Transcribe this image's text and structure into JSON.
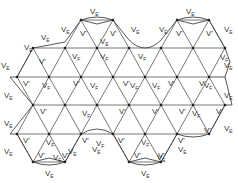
{
  "diagram": {
    "type": "triangular-lattice",
    "colors": {
      "line": "#555555",
      "boundary": "#444444",
      "text": "#333333",
      "background": "#ffffff"
    },
    "labels": {
      "edge_vertex": {
        "main": "V",
        "sub": "E"
      },
      "interior_vertex_prime": "V'",
      "interior_vertex_f": {
        "main": "V",
        "sub": "F"
      }
    },
    "rows_y": [
      20,
      48,
      77,
      105,
      134,
      162
    ],
    "nodes": [
      {
        "x": 81,
        "y": 20
      },
      {
        "x": 113,
        "y": 20
      },
      {
        "x": 177,
        "y": 20
      },
      {
        "x": 209,
        "y": 20
      },
      {
        "x": 33,
        "y": 48
      },
      {
        "x": 65,
        "y": 48
      },
      {
        "x": 97,
        "y": 48
      },
      {
        "x": 129,
        "y": 48
      },
      {
        "x": 161,
        "y": 48
      },
      {
        "x": 193,
        "y": 48
      },
      {
        "x": 225,
        "y": 48
      },
      {
        "x": 17,
        "y": 77
      },
      {
        "x": 49,
        "y": 77
      },
      {
        "x": 81,
        "y": 77
      },
      {
        "x": 113,
        "y": 77
      },
      {
        "x": 145,
        "y": 77
      },
      {
        "x": 177,
        "y": 77
      },
      {
        "x": 209,
        "y": 77
      },
      {
        "x": 33,
        "y": 105
      },
      {
        "x": 65,
        "y": 105
      },
      {
        "x": 97,
        "y": 105
      },
      {
        "x": 129,
        "y": 105
      },
      {
        "x": 161,
        "y": 105
      },
      {
        "x": 193,
        "y": 105
      },
      {
        "x": 225,
        "y": 105
      },
      {
        "x": 17,
        "y": 134
      },
      {
        "x": 49,
        "y": 134
      },
      {
        "x": 81,
        "y": 134
      },
      {
        "x": 113,
        "y": 134
      },
      {
        "x": 145,
        "y": 134
      },
      {
        "x": 177,
        "y": 134
      },
      {
        "x": 209,
        "y": 134
      },
      {
        "x": 33,
        "y": 162
      },
      {
        "x": 65,
        "y": 162
      },
      {
        "x": 129,
        "y": 162
      },
      {
        "x": 161,
        "y": 162
      }
    ],
    "ve_labels": [
      {
        "x": 90,
        "y": 8
      },
      {
        "x": 186,
        "y": 8
      },
      {
        "x": 61,
        "y": 26
      },
      {
        "x": 131,
        "y": 26
      },
      {
        "x": 159,
        "y": 26
      },
      {
        "x": 224,
        "y": 26
      },
      {
        "x": 41,
        "y": 34
      },
      {
        "x": 24,
        "y": 44
      },
      {
        "x": 100,
        "y": 38
      },
      {
        "x": 1,
        "y": 62
      },
      {
        "x": 224,
        "y": 62
      },
      {
        "x": 4,
        "y": 92
      },
      {
        "x": 224,
        "y": 92
      },
      {
        "x": 4,
        "y": 120
      },
      {
        "x": 224,
        "y": 125
      },
      {
        "x": 4,
        "y": 148
      },
      {
        "x": 68,
        "y": 148
      },
      {
        "x": 92,
        "y": 146
      },
      {
        "x": 178,
        "y": 146
      },
      {
        "x": 45,
        "y": 170
      },
      {
        "x": 141,
        "y": 170
      },
      {
        "x": 53,
        "y": 154
      },
      {
        "x": 157,
        "y": 154
      }
    ],
    "vprime_labels": [
      {
        "x": 80,
        "y": 30
      },
      {
        "x": 110,
        "y": 30
      },
      {
        "x": 176,
        "y": 30
      },
      {
        "x": 206,
        "y": 30
      },
      {
        "x": 39,
        "y": 58
      },
      {
        "x": 23,
        "y": 80
      },
      {
        "x": 73,
        "y": 80
      },
      {
        "x": 123,
        "y": 80
      },
      {
        "x": 168,
        "y": 80
      },
      {
        "x": 199,
        "y": 80
      },
      {
        "x": 40,
        "y": 108
      },
      {
        "x": 119,
        "y": 108
      },
      {
        "x": 152,
        "y": 108
      },
      {
        "x": 179,
        "y": 108
      },
      {
        "x": 216,
        "y": 108
      },
      {
        "x": 23,
        "y": 137
      },
      {
        "x": 82,
        "y": 137
      },
      {
        "x": 118,
        "y": 137
      },
      {
        "x": 178,
        "y": 137
      },
      {
        "x": 204,
        "y": 127
      },
      {
        "x": 38,
        "y": 152
      },
      {
        "x": 62,
        "y": 152
      },
      {
        "x": 134,
        "y": 152
      },
      {
        "x": 158,
        "y": 152
      }
    ],
    "vf_labels": [
      {
        "x": 72,
        "y": 53
      },
      {
        "x": 100,
        "y": 53
      },
      {
        "x": 220,
        "y": 54
      },
      {
        "x": 138,
        "y": 53
      },
      {
        "x": 42,
        "y": 82
      },
      {
        "x": 152,
        "y": 82
      },
      {
        "x": 204,
        "y": 82
      },
      {
        "x": 90,
        "y": 82
      },
      {
        "x": 82,
        "y": 110
      },
      {
        "x": 192,
        "y": 110
      },
      {
        "x": 130,
        "y": 82
      },
      {
        "x": 46,
        "y": 139
      },
      {
        "x": 141,
        "y": 139
      },
      {
        "x": 96,
        "y": 140
      }
    ]
  }
}
